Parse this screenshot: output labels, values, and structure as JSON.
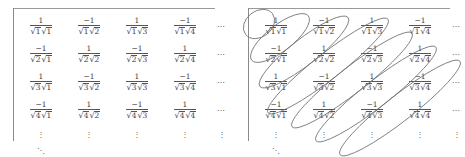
{
  "figure": {
    "ellipsis_horizontal": "⋯",
    "ellipsis_vertical": "⋮",
    "ellipsis_diagonal": "⋱",
    "radical_sign": "√",
    "colors": {
      "background": "#ffffff",
      "text": "#3d3d3d",
      "rule": "#555555",
      "bracket": "#8a8a8a",
      "ellipse_stroke": "#6f6f6f"
    }
  },
  "matrices": [
    {
      "name": "plain-array",
      "annotated": false,
      "rows": [
        {
          "cells": [
            {
              "numerator": "1",
              "den_left": "1",
              "den_right": "1"
            },
            {
              "numerator": "−1",
              "den_left": "1",
              "den_right": "2"
            },
            {
              "numerator": "1",
              "den_left": "1",
              "den_right": "3"
            },
            {
              "numerator": "−1",
              "den_left": "1",
              "den_right": "4"
            }
          ],
          "tail": "⋯"
        },
        {
          "cells": [
            {
              "numerator": "−1",
              "den_left": "2",
              "den_right": "1"
            },
            {
              "numerator": "1",
              "den_left": "2",
              "den_right": "2"
            },
            {
              "numerator": "−1",
              "den_left": "2",
              "den_right": "3"
            },
            {
              "numerator": "1",
              "den_left": "2",
              "den_right": "4"
            }
          ],
          "tail": "⋯"
        },
        {
          "cells": [
            {
              "numerator": "1",
              "den_left": "3",
              "den_right": "1"
            },
            {
              "numerator": "−1",
              "den_left": "3",
              "den_right": "2"
            },
            {
              "numerator": "1",
              "den_left": "3",
              "den_right": "3"
            },
            {
              "numerator": "−1",
              "den_left": "3",
              "den_right": "4"
            }
          ],
          "tail": "⋯"
        },
        {
          "cells": [
            {
              "numerator": "−1",
              "den_left": "4",
              "den_right": "1"
            },
            {
              "numerator": "1",
              "den_left": "4",
              "den_right": "2"
            },
            {
              "numerator": "−1",
              "den_left": "4",
              "den_right": "3"
            },
            {
              "numerator": "1",
              "den_left": "4",
              "den_right": "4"
            }
          ],
          "tail": "⋯"
        }
      ],
      "bottom": {
        "columns": [
          "⋮",
          "⋮",
          "⋮",
          "⋮",
          "⋮"
        ],
        "corner": "⋱"
      }
    },
    {
      "name": "array-with-circled-antidiagonals",
      "annotated": true,
      "rows": [
        {
          "cells": [
            {
              "numerator": "1",
              "den_left": "1",
              "den_right": "1"
            },
            {
              "numerator": "−1",
              "den_left": "1",
              "den_right": "2"
            },
            {
              "numerator": "1",
              "den_left": "1",
              "den_right": "3"
            },
            {
              "numerator": "−1",
              "den_left": "1",
              "den_right": "4"
            }
          ],
          "tail": "⋯"
        },
        {
          "cells": [
            {
              "numerator": "−1",
              "den_left": "2",
              "den_right": "1"
            },
            {
              "numerator": "1",
              "den_left": "2",
              "den_right": "2"
            },
            {
              "numerator": "−1",
              "den_left": "2",
              "den_right": "3"
            },
            {
              "numerator": "1",
              "den_left": "2",
              "den_right": "4"
            }
          ],
          "tail": "⋯"
        },
        {
          "cells": [
            {
              "numerator": "1",
              "den_left": "3",
              "den_right": "1"
            },
            {
              "numerator": "−1",
              "den_left": "3",
              "den_right": "2"
            },
            {
              "numerator": "1",
              "den_left": "3",
              "den_right": "3"
            },
            {
              "numerator": "−1",
              "den_left": "3",
              "den_right": "4"
            }
          ],
          "tail": "⋯"
        },
        {
          "cells": [
            {
              "numerator": "−1",
              "den_left": "4",
              "den_right": "1"
            },
            {
              "numerator": "1",
              "den_left": "4",
              "den_right": "2"
            },
            {
              "numerator": "−1",
              "den_left": "4",
              "den_right": "3"
            },
            {
              "numerator": "1",
              "den_left": "4",
              "den_right": "4"
            }
          ],
          "tail": "⋯"
        }
      ],
      "bottom": {
        "columns": [
          "⋮",
          "⋮",
          "⋮",
          "⋮",
          "⋮"
        ],
        "corner": "⋱"
      },
      "annotations": [
        {
          "label": "antidiagonal-1",
          "cx": 24,
          "cy": 24,
          "rx": 17,
          "ry": 13,
          "angle": -38
        },
        {
          "label": "antidiagonal-2",
          "cx": 45,
          "cy": 38,
          "rx": 36,
          "ry": 13,
          "angle": -38
        },
        {
          "label": "antidiagonal-3",
          "cx": 69,
          "cy": 52,
          "rx": 56,
          "ry": 13,
          "angle": -38
        },
        {
          "label": "antidiagonal-4",
          "cx": 93,
          "cy": 66,
          "rx": 76,
          "ry": 13,
          "angle": -38
        },
        {
          "label": "antidiagonal-5",
          "cx": 117,
          "cy": 80,
          "rx": 76,
          "ry": 13,
          "angle": -38
        },
        {
          "label": "antidiagonal-6",
          "cx": 141,
          "cy": 94,
          "rx": 76,
          "ry": 13,
          "angle": -38
        },
        {
          "label": "antidiagonal-7",
          "cx": 165,
          "cy": 108,
          "rx": 76,
          "ry": 13,
          "angle": -38
        }
      ]
    }
  ]
}
